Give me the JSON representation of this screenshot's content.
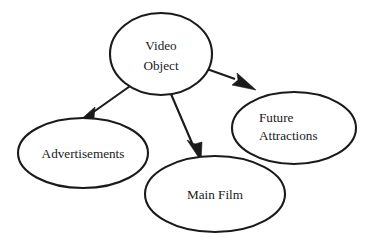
{
  "diagram": {
    "type": "node-link-hierarchy",
    "background_color": "#ffffff",
    "stroke_color": "#1a1a1a",
    "root_node": "video-object",
    "nodes": [
      {
        "id": "video-object",
        "label_lines": [
          "Video",
          "Object"
        ],
        "label_line1": "Video",
        "label_line2": "Object",
        "shape": "ellipse",
        "align": "center",
        "cx": 161,
        "cy": 54,
        "rx": 51,
        "ry": 41
      },
      {
        "id": "advertisements",
        "label_lines": [
          "Advertisements"
        ],
        "label_line1": "Advertisements",
        "shape": "ellipse",
        "align": "center",
        "cx": 83,
        "cy": 153,
        "rx": 65,
        "ry": 35
      },
      {
        "id": "main-film",
        "label_lines": [
          "Main Film"
        ],
        "label_line1": "Main Film",
        "shape": "ellipse",
        "align": "center",
        "cx": 215,
        "cy": 194,
        "rx": 70,
        "ry": 38
      },
      {
        "id": "future-attractions",
        "label_lines": [
          "Future",
          "Attractions"
        ],
        "label_line1": "Future",
        "label_line2": "Attractions",
        "shape": "ellipse",
        "align": "left",
        "cx": 294,
        "cy": 128,
        "rx": 62,
        "ry": 36
      }
    ],
    "edges": [
      {
        "id": "edge-video-object-to-advertisements",
        "from": "video-object",
        "to": "advertisements",
        "arrowhead": "solid-triangle",
        "direction": "down-left"
      },
      {
        "id": "edge-video-object-to-main-film",
        "from": "video-object",
        "to": "main-film",
        "arrowhead": "solid-triangle",
        "direction": "down-right"
      },
      {
        "id": "edge-video-object-to-future-attractions",
        "from": "video-object",
        "to": "future-attractions",
        "arrowhead": "solid-triangle",
        "direction": "right-down"
      }
    ]
  }
}
